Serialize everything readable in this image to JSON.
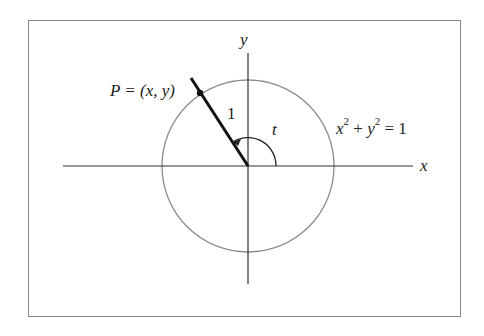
{
  "diagram": {
    "type": "unit-circle",
    "axes": {
      "x_label": "x",
      "y_label": "y"
    },
    "circle": {
      "equation": {
        "x": "x",
        "x_exp": "2",
        "plus": "+",
        "y": "y",
        "y_exp": "2",
        "equals": "= 1"
      }
    },
    "point": {
      "label": "P = (x, y)"
    },
    "radius_label": "1",
    "angle_label": "t",
    "colors": {
      "frame": "#8a8a8a",
      "axes": "#333333",
      "circle": "#8c8c8c",
      "radius_line": "#111111",
      "text": "#222222"
    }
  }
}
